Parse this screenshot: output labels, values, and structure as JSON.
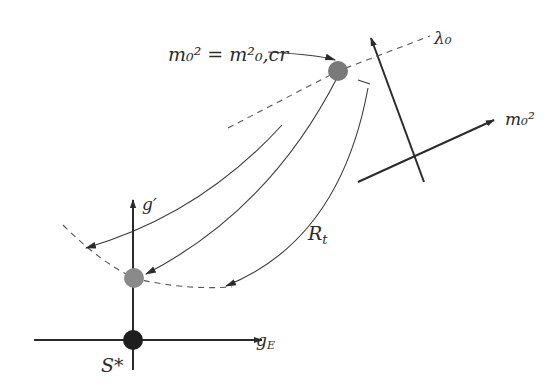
{
  "diagram": {
    "labels": {
      "critical_point": "m₀² = m²₀,cr",
      "lambda_axis": "λ₀",
      "mass_axis": "m₀²",
      "g_prime_axis": "g′",
      "g_E_axis": "g",
      "g_E_sub": "E",
      "fixed_point": "S*",
      "trajectory": "R",
      "trajectory_sub": "t"
    },
    "points": {
      "critical_point": {
        "x": 338,
        "y": 71,
        "color": "#7a7a7a"
      },
      "projected_point": {
        "x": 134,
        "y": 278,
        "color": "#8a8a8a"
      },
      "fixed_point": {
        "x": 133,
        "y": 340,
        "color": "#1e1e1e"
      }
    },
    "colors": {
      "line": "#2b2b2b",
      "dashed": "#555555",
      "background": "#ffffff"
    }
  }
}
